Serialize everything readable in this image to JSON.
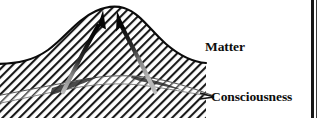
{
  "figure": {
    "type": "conceptual-diagram",
    "background_color": "#ffffff",
    "ink_color": "#111111",
    "hatch_color": "#1a1a1a",
    "labels": {
      "matter": "Matter",
      "consciousness": "Consciousness"
    },
    "arrows": {
      "count": 2,
      "direction": "upward-converging",
      "color": "#080808",
      "left_arrow_name": "ascending-arrow-left",
      "right_arrow_name": "ascending-arrow-right"
    },
    "curves": {
      "upper_name": "matter-bell-curve",
      "lower_name": "consciousness-band"
    },
    "page_border": {
      "visible": true,
      "color": "#171717",
      "position": "right"
    }
  }
}
